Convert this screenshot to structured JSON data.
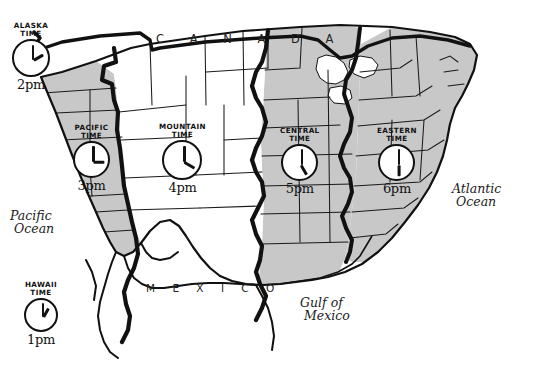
{
  "map": {
    "title": "United States Time Zones",
    "background_color": "#ffffff",
    "ink_color": "#111111",
    "shaded_zone_fill": "#c8c8c8",
    "unshaded_zone_fill": "#ffffff",
    "countries": [
      {
        "name": "CANADA",
        "display": "C A N A D A"
      },
      {
        "name": "MEXICO",
        "display": "M E X I C O"
      }
    ],
    "water_labels": [
      {
        "name": "Pacific Ocean",
        "line1": "Pacific",
        "line2": "Ocean"
      },
      {
        "name": "Atlantic Ocean",
        "line1": "Atlantic",
        "line2": "Ocean"
      },
      {
        "name": "Gulf of Mexico",
        "line1": "Gulf of",
        "line2": "Mexico"
      }
    ],
    "time_zones": [
      {
        "id": "alaska",
        "label_line1": "ALASKA",
        "label_line2": "TIME",
        "time": "2pm",
        "hour": 2,
        "minute": 0,
        "shaded": false
      },
      {
        "id": "hawaii",
        "label_line1": "HAWAII",
        "label_line2": "TIME",
        "time": "1pm",
        "hour": 1,
        "minute": 0,
        "shaded": false
      },
      {
        "id": "pacific",
        "label_line1": "PACIFIC",
        "label_line2": "TIME",
        "time": "3pm",
        "hour": 3,
        "minute": 0,
        "shaded": true
      },
      {
        "id": "mountain",
        "label_line1": "MOUNTAIN",
        "label_line2": "TIME",
        "time": "4pm",
        "hour": 4,
        "minute": 0,
        "shaded": false
      },
      {
        "id": "central",
        "label_line1": "CENTRAL",
        "label_line2": "TIME",
        "time": "5pm",
        "hour": 5,
        "minute": 0,
        "shaded": true
      },
      {
        "id": "eastern",
        "label_line1": "EASTERN",
        "label_line2": "TIME",
        "time": "6pm",
        "hour": 6,
        "minute": 0,
        "shaded": true
      }
    ]
  }
}
